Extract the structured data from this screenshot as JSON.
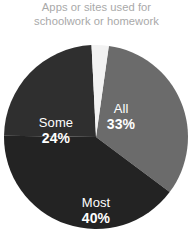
{
  "chart_data": {
    "type": "pie",
    "title": "Apps or sites used for schoolwork or homework",
    "title_lines": [
      "Apps or sites used for",
      "schoolwork or homework"
    ],
    "xlabel": "",
    "ylabel": "",
    "legend_position": "none",
    "grid": false,
    "labels_inside_slices": true,
    "categories": [
      "All",
      "Most",
      "Some",
      "None"
    ],
    "values": [
      33,
      40,
      24,
      3
    ],
    "value_suffix": "%",
    "slices": [
      {
        "name": "All",
        "label": "All",
        "value": 33,
        "value_label": "33%",
        "color": "#6b6b6b",
        "start_angle_deg": 8,
        "end_angle_deg": 126.8,
        "labeled": true
      },
      {
        "name": "Most",
        "label": "Most",
        "value": 40,
        "value_label": "40%",
        "color": "#232323",
        "start_angle_deg": 126.8,
        "end_angle_deg": 270.8,
        "labeled": true
      },
      {
        "name": "Some",
        "label": "Some",
        "value": 24,
        "value_label": "24%",
        "color": "#2f2f2f",
        "start_angle_deg": 270.8,
        "end_angle_deg": 357.2,
        "labeled": true
      },
      {
        "name": "None",
        "label": "",
        "value": 3,
        "value_label": "",
        "color": "#f2f2f2",
        "start_angle_deg": 357.2,
        "end_angle_deg": 368,
        "labeled": false
      }
    ],
    "colors": {
      "all": "#6b6b6b",
      "most": "#232323",
      "some": "#2f2f2f",
      "gap": "#f2f2f2",
      "title_text": "#a9a9a9",
      "label_text": "#ffffff",
      "background": "#ffffff"
    },
    "geometry": {
      "center_x": 96,
      "center_y": 101,
      "radius": 92
    }
  }
}
